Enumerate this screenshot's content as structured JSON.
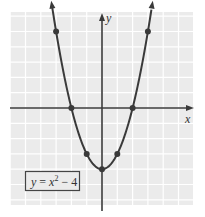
{
  "chart_data": {
    "type": "line",
    "title": "",
    "equation": "y = x^2 - 4",
    "legend": [
      "y = x² − 4"
    ],
    "xlabel": "x",
    "ylabel": "y",
    "xlim": [
      -6,
      6
    ],
    "ylim": [
      -6.3,
      6.3
    ],
    "grid": true,
    "tick_labels_shown": false,
    "series": [
      {
        "name": "y = x² − 4",
        "curve": "parabola",
        "marked_points": [
          {
            "x": -3,
            "y": 5
          },
          {
            "x": -2,
            "y": 0
          },
          {
            "x": -1,
            "y": -3
          },
          {
            "x": 0,
            "y": -4
          },
          {
            "x": 1,
            "y": -3
          },
          {
            "x": 2,
            "y": 0
          },
          {
            "x": 3,
            "y": 5
          }
        ],
        "arrows_on_ends": true
      }
    ]
  },
  "labels": {
    "x_axis": "x",
    "y_axis": "y",
    "equation_box": {
      "y": "y",
      "eq": " = ",
      "x": "x",
      "exp": "2",
      "rest": " − 4"
    }
  },
  "colors": {
    "grid_background": "#ebebeb",
    "grid_lines": "#ffffff",
    "curve": "#3a3a3a",
    "axes": "#3a3a3a",
    "label_box_border": "#444444"
  }
}
